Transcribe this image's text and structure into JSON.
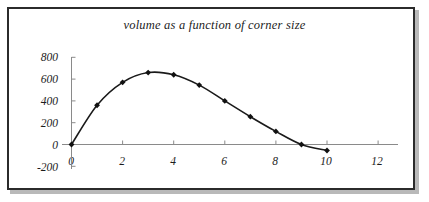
{
  "figure": {
    "title": "volume as a function of corner size",
    "frame_color": "#2b2b2b",
    "axis_color": "#8a8a8a",
    "curve_color": "#1a1a1a",
    "marker_color": "#111111",
    "background": "#ffffff"
  },
  "chart_data": {
    "type": "line",
    "title": "volume as a function of corner size",
    "xlabel": "",
    "ylabel": "",
    "x": [
      0,
      1,
      2,
      3,
      4,
      5,
      6,
      7,
      8,
      9,
      10
    ],
    "values": [
      0,
      360,
      570,
      660,
      640,
      545,
      400,
      255,
      120,
      0,
      -55
    ],
    "series": [
      {
        "name": "volume",
        "values": [
          0,
          360,
          570,
          660,
          640,
          545,
          400,
          255,
          120,
          0,
          -55
        ]
      }
    ],
    "xlim": [
      0,
      12
    ],
    "ylim": [
      -200,
      800
    ],
    "xticks": [
      0,
      2,
      4,
      6,
      8,
      10,
      12
    ],
    "xtick_labels": [
      "0",
      "2",
      "4",
      "6",
      "8",
      "10",
      "12"
    ],
    "yticks": [
      -200,
      0,
      200,
      400,
      600,
      800
    ],
    "ytick_labels": [
      "-200",
      "0",
      "200",
      "400",
      "600",
      "800"
    ],
    "grid": false,
    "legend": false,
    "markers": "diamond"
  }
}
